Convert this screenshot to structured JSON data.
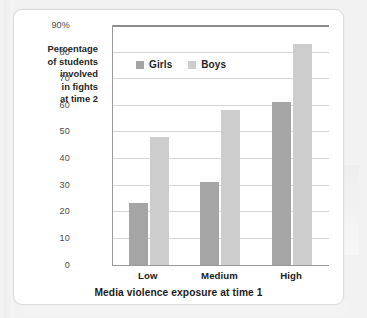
{
  "chart_data": {
    "type": "bar",
    "title": "",
    "categories": [
      "Low",
      "Medium",
      "High"
    ],
    "series": [
      {
        "name": "Girls",
        "values": [
          23,
          31,
          61
        ],
        "color": "#a5a5a5"
      },
      {
        "name": "Boys",
        "values": [
          48,
          58,
          83
        ],
        "color": "#cdcdcd"
      }
    ],
    "xlabel": "Media violence exposure at time 1",
    "ylabel": "Percentage of students involved in fights at time 2",
    "ylabel_lines": [
      "Percentage",
      "of students",
      "involved",
      "in fights",
      "at time 2"
    ],
    "ylim": [
      0,
      90
    ],
    "ytick_values": [
      0,
      10,
      20,
      30,
      40,
      50,
      60,
      70,
      80,
      90
    ],
    "ytick_labels": [
      "0",
      "10",
      "20",
      "30",
      "40",
      "50",
      "60",
      "70",
      "80",
      "90%"
    ],
    "grid": "horizontal",
    "legend_position": "upper-left-inside",
    "bar_orientation": "vertical"
  },
  "legend": {
    "items": [
      {
        "label": "Girls",
        "color": "#a5a5a5"
      },
      {
        "label": "Boys",
        "color": "#cdcdcd"
      }
    ]
  },
  "colors": {
    "girls": "#a5a5a5",
    "boys": "#cdcdcd",
    "gridline": "#d6d6d6",
    "axis": "#9a9a9a",
    "card_background": "#ffffff",
    "page_background": "#f2f2f2",
    "text": "#1f1f1f"
  }
}
